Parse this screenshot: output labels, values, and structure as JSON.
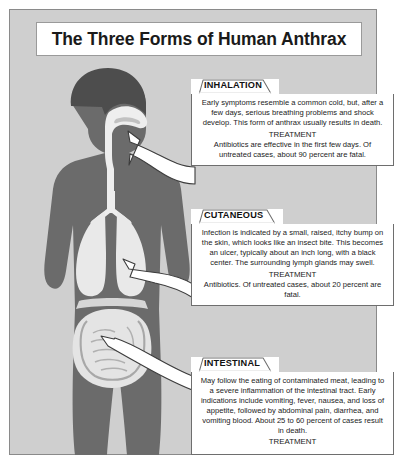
{
  "poster": {
    "title": "The Three Forms of Human Anthrax",
    "background_color": "#cfcfcf",
    "figure_color": "#6b6b6b",
    "organ_color": "#e8e8e8"
  },
  "figure": {
    "name": "human-body-silhouette",
    "organs": [
      "nasal-passage",
      "trachea",
      "lungs",
      "diaphragm",
      "intestines"
    ]
  },
  "callouts": [
    {
      "id": "inhalation",
      "label": "INHALATION",
      "description": "Early symptoms resemble a common cold, but, after a few days, serious breathing problems and shock develop. This form of anthrax usually results in death.",
      "treatment_heading": "TREATMENT",
      "treatment": "Antibiotics are effective in the first few days. Of untreated cases, about 90 percent are fatal.",
      "arrow_target": "nasal-passage"
    },
    {
      "id": "cutaneous",
      "label": "CUTANEOUS",
      "description": "Infection is indicated by a small, raised, itchy bump on the skin, which looks like an insect bite. This becomes an ulcer, typically about an inch long, with a black center. The surrounding lymph glands may swell.",
      "treatment_heading": "TREATMENT",
      "treatment": "Antibiotics. Of untreated cases, about 20 percent are fatal.",
      "arrow_target": "skin-torso"
    },
    {
      "id": "intestinal",
      "label": "INTESTINAL",
      "description": "May follow the eating of contaminated meat, leading to a severe inflammation of the intestinal tract. Early indications include vomiting, fever, nausea, and loss of appetite, followed by abdominal pain, diarrhea, and vomiting blood. About 25 to 60 percent of cases result in death.",
      "treatment_heading": "TREATMENT",
      "treatment": "",
      "arrow_target": "intestines"
    }
  ]
}
